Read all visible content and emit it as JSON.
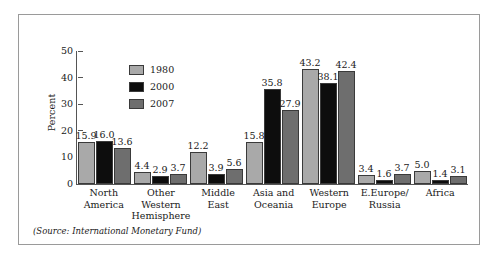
{
  "figure": {
    "source_note": "(Source: International Monetary Fund)"
  },
  "chart_data": {
    "type": "bar",
    "title": "",
    "xlabel": "",
    "ylabel": "Percent",
    "ylim": [
      0,
      50
    ],
    "yticks": [
      50,
      40,
      30,
      20,
      10,
      0
    ],
    "grid": false,
    "legend_position": "inside-top-left",
    "categories": [
      "North America",
      "Other Western Hemisphere",
      "Middle East",
      "Asia and Oceania",
      "Western Europe",
      "E.Europe/ Russia",
      "Africa"
    ],
    "category_lines": [
      [
        "North",
        "America"
      ],
      [
        "Other",
        "Western",
        "Hemisphere"
      ],
      [
        "Middle",
        "East"
      ],
      [
        "Asia and",
        "Oceania"
      ],
      [
        "Western",
        "Europe"
      ],
      [
        "E.Europe/",
        "Russia"
      ],
      [
        "Africa"
      ]
    ],
    "series": [
      {
        "name": "1980",
        "color": "#a9a9a9",
        "values": [
          15.9,
          4.4,
          12.2,
          15.8,
          43.2,
          3.4,
          5.0
        ],
        "labels": [
          "15.9",
          "4.4",
          "12.2",
          "15.8",
          "43.2",
          "3.4",
          "5.0"
        ]
      },
      {
        "name": "2000",
        "color": "#0d0d0d",
        "values": [
          16.0,
          2.9,
          3.9,
          35.8,
          38.1,
          1.6,
          1.4
        ],
        "labels": [
          "16.0",
          "2.9",
          "3.9",
          "35.8",
          "38.1",
          "1.6",
          "1.4"
        ]
      },
      {
        "name": "2007",
        "color": "#6e6e6e",
        "values": [
          13.6,
          3.7,
          5.6,
          27.9,
          42.4,
          3.7,
          3.1
        ],
        "labels": [
          "13.6",
          "3.7",
          "5.6",
          "27.9",
          "42.4",
          "3.7",
          "3.1"
        ]
      }
    ]
  }
}
